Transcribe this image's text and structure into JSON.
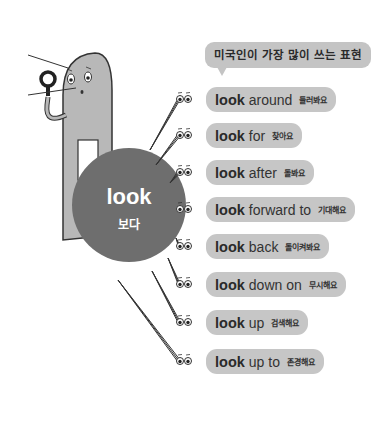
{
  "callout": {
    "text": "미국인이 가장 많이 쓰는 표현"
  },
  "center": {
    "word": "look",
    "meaning": "보다",
    "color": "#6e6e6e"
  },
  "pill_color": "#c6c6c6",
  "phrases": [
    {
      "keyword": "look",
      "rest": "around",
      "meaning": "둘러봐요"
    },
    {
      "keyword": "look",
      "rest": "for",
      "meaning": "찾아요"
    },
    {
      "keyword": "look",
      "rest": "after",
      "meaning": "돌봐요"
    },
    {
      "keyword": "look",
      "rest": "forward to",
      "meaning": "기대해요"
    },
    {
      "keyword": "look",
      "rest": "back",
      "meaning": "돌이켜봐요"
    },
    {
      "keyword": "look",
      "rest": "down on",
      "meaning": "무시해요"
    },
    {
      "keyword": "look",
      "rest": "up",
      "meaning": "검색해요"
    },
    {
      "keyword": "look",
      "rest": "up to",
      "meaning": "존경해요"
    }
  ]
}
